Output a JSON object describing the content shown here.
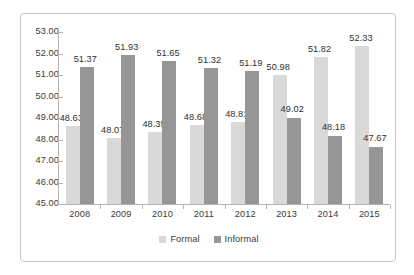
{
  "chart_data": {
    "type": "bar",
    "title": "",
    "subtitle": "",
    "xlabel": "",
    "ylabel": "",
    "categories": [
      "2008",
      "2009",
      "2010",
      "2011",
      "2012",
      "2013",
      "2014",
      "2015"
    ],
    "series": [
      {
        "name": "Formal",
        "color": "#d9d9d9",
        "values": [
          48.63,
          48.07,
          48.35,
          48.68,
          48.81,
          50.98,
          51.82,
          52.33
        ],
        "labels": [
          "48.63",
          "48.07",
          "48.35",
          "48.68",
          "48.81",
          "50.98",
          "51.82",
          "52.33"
        ]
      },
      {
        "name": "Informal",
        "color": "#969696",
        "values": [
          51.37,
          51.93,
          51.65,
          51.32,
          51.19,
          49.02,
          48.18,
          47.67
        ],
        "labels": [
          "51.37",
          "51.93",
          "51.65",
          "51.32",
          "51.19",
          "49.02",
          "48.18",
          "47.67"
        ]
      }
    ],
    "ylim": [
      45.0,
      53.0
    ],
    "ytick_values": [
      53.0,
      52.0,
      51.0,
      50.0,
      49.0,
      48.0,
      47.0,
      46.0,
      45.0
    ],
    "ytick_labels": [
      "53.00",
      "52.00",
      "51.00",
      "50.00",
      "49.00",
      "48.00",
      "47.00",
      "46.00",
      "45.00"
    ],
    "grid": false,
    "legend_position": "bottom",
    "data_labels_shown": true
  },
  "legend": {
    "items": [
      {
        "label": "Formal",
        "color": "#d9d9d9"
      },
      {
        "label": "Informal",
        "color": "#969696"
      }
    ]
  },
  "colors": {
    "formal": "#d9d9d9",
    "informal": "#969696",
    "axis": "#b4b4b4",
    "border": "#c9c9c9",
    "text": "#3a3a3a",
    "background": "#ffffff"
  }
}
